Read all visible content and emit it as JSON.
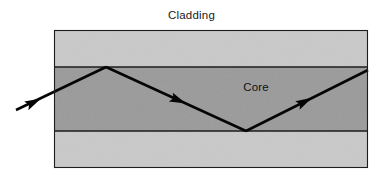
{
  "figure": {
    "width": 383,
    "height": 181,
    "background_color": "#ffffff"
  },
  "labels": {
    "cladding": "Cladding",
    "core": "Core"
  },
  "colors": {
    "cladding_fill": "#c9c9c9",
    "core_fill": "#9a9a9a",
    "outline": "#1c1c1c",
    "ray_stroke": "#050505",
    "text": "#1a1a1a",
    "background": "#ffffff"
  },
  "chart_data": {
    "type": "diagram",
    "regions": [
      {
        "name": "cladding-top",
        "label": "Cladding",
        "fill": "#c9c9c9",
        "x": 54,
        "y": 30,
        "width": 314,
        "height": 37
      },
      {
        "name": "core",
        "label": "Core",
        "fill": "#9a9a9a",
        "x": 54,
        "y": 67,
        "width": 314,
        "height": 64
      },
      {
        "name": "cladding-bottom",
        "label": "Cladding",
        "fill": "#c9c9c9",
        "x": 54,
        "y": 131,
        "width": 314,
        "height": 37
      }
    ],
    "boundaries": [
      {
        "name": "core-cladding-top-interface",
        "y": 67,
        "x1": 54,
        "x2": 368
      },
      {
        "name": "core-cladding-bottom-interface",
        "y": 131,
        "x1": 54,
        "x2": 368
      }
    ],
    "ray_path": {
      "name": "light-ray",
      "points": [
        {
          "x": 16,
          "y": 110,
          "note": "entry outside fiber"
        },
        {
          "x": 106,
          "y": 67,
          "note": "reflection at upper core-cladding interface"
        },
        {
          "x": 246,
          "y": 131,
          "note": "reflection at lower core-cladding interface"
        },
        {
          "x": 368,
          "y": 70,
          "note": "exit at right edge"
        }
      ],
      "arrow_positions": [
        {
          "x": 40,
          "y": 101,
          "angle_deg": -25.5
        },
        {
          "x": 182,
          "y": 100,
          "angle_deg": 24.6
        },
        {
          "x": 308,
          "y": 98,
          "angle_deg": -26.5
        }
      ]
    },
    "text_annotations": [
      {
        "text": "Cladding",
        "x": 262,
        "y": 20,
        "anchor": "middle"
      },
      {
        "text": "Core",
        "x": 256,
        "y": 92,
        "anchor": "middle"
      }
    ]
  }
}
